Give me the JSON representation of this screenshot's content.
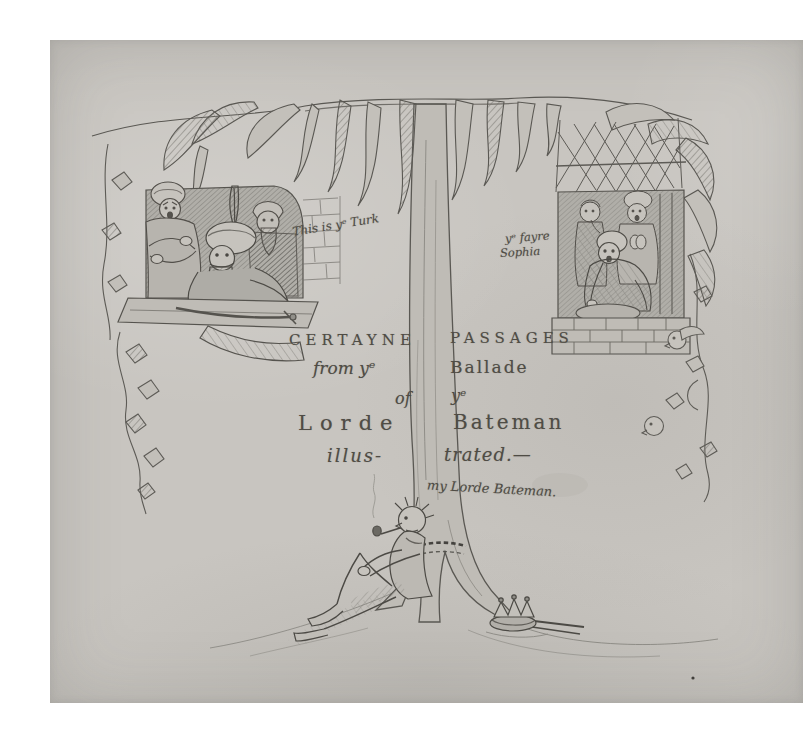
{
  "artwork": {
    "kind": "pencil drawing / illustrated title page",
    "colors": {
      "margin": "#ffffff",
      "paper": "#c8c5c0",
      "pencil": "#4f4c45",
      "pencil_light": "#8b8984"
    }
  },
  "title": {
    "row1": {
      "left": "CERTAYNE",
      "right": "PASSAGES"
    },
    "row2": {
      "left": "from yᵉ",
      "right": "Ballade"
    },
    "row3": {
      "left": "of",
      "right": "yᵉ"
    },
    "row4": {
      "left": "Lorde",
      "right": "Bateman"
    },
    "row5": {
      "left": "illus-",
      "right": "trated.—"
    }
  },
  "captions": {
    "turk": "This is yᵉ Turk",
    "sophia_line1": "yᵉ fayre",
    "sophia_line2": "Sophia",
    "bateman": "my Lorde Bateman."
  }
}
